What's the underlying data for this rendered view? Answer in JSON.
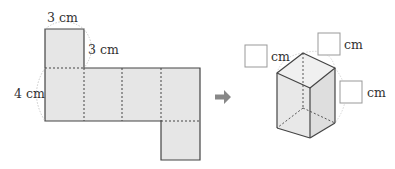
{
  "net": {
    "labels": {
      "top_width": "3 cm",
      "top_height": "3 cm",
      "side_height": "4 cm"
    }
  },
  "arrow": {
    "icon": "arrow-right-icon"
  },
  "prism": {
    "answer_boxes": [
      {
        "value": "",
        "unit": "cm"
      },
      {
        "value": "",
        "unit": "cm"
      },
      {
        "value": "",
        "unit": "cm"
      }
    ]
  },
  "colors": {
    "face_fill": "#e6e6e6",
    "edge": "#444444",
    "guide": "#bbbbbb",
    "arrow": "#888888",
    "box_border": "#999999"
  }
}
